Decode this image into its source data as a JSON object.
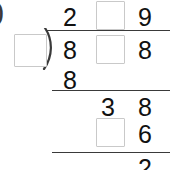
{
  "worksheet": {
    "type": "long-division",
    "edge_glyph": ")",
    "divisor": {
      "value": "",
      "is_blank": true
    },
    "quotient": {
      "label": "quotient",
      "cells": [
        {
          "value": "2",
          "is_blank": false
        },
        {
          "value": "",
          "is_blank": true
        },
        {
          "value": "9",
          "is_blank": false
        }
      ]
    },
    "dividend": {
      "label": "dividend",
      "cells": [
        {
          "value": "8",
          "is_blank": false
        },
        {
          "value": "",
          "is_blank": true
        },
        {
          "value": "8",
          "is_blank": false
        }
      ]
    },
    "work_rows": [
      {
        "label": "first-subtrahend",
        "cells": [
          {
            "value": "8",
            "is_blank": false
          }
        ]
      },
      {
        "label": "first-remainder",
        "cells": [
          {
            "value": "3",
            "is_blank": false
          },
          {
            "value": "8",
            "is_blank": false
          }
        ]
      },
      {
        "label": "second-subtrahend",
        "cells": [
          {
            "value": "",
            "is_blank": true
          },
          {
            "value": "6",
            "is_blank": false
          }
        ]
      },
      {
        "label": "final-remainder",
        "cells": [
          {
            "value": "2",
            "is_blank": false
          }
        ]
      }
    ],
    "colors": {
      "ink": "#111111",
      "rule": "#3a3a3a",
      "box_border": "#c9c9c9",
      "background": "#ffffff"
    }
  }
}
